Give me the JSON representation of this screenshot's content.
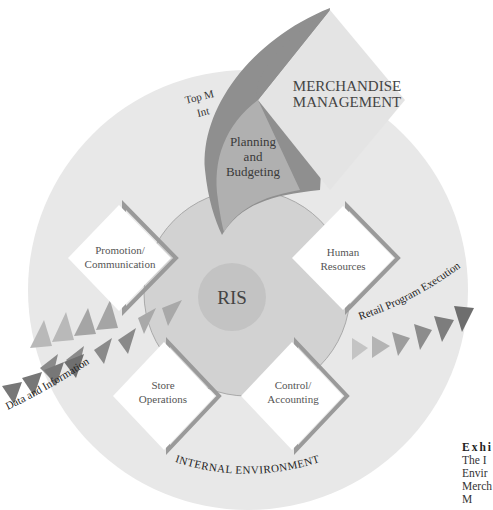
{
  "diagram": {
    "colors": {
      "outer_ring": "#e8e8e8",
      "inner_circle": "#d2d2d2",
      "ris_circle": "#c3c3c3",
      "diamond_fill": "#ffffff",
      "diamond_shadow": "#9a9a9a",
      "merch_diamond": "#e4e4e4",
      "swoosh_dark": "#8f8f8f",
      "swoosh_light": "#b0b0b0",
      "text": "#333333"
    },
    "outer_label": "INTERNAL ENVIRONMENT",
    "center_label": "RIS",
    "merchandise": {
      "line1": "MERCHANDISE",
      "line2": "MANAGEMENT"
    },
    "planning": {
      "line1": "Planning",
      "line2": "and",
      "line3": "Budgeting"
    },
    "top_management": {
      "line1": "Top M",
      "line2": "Int"
    },
    "diamonds": [
      {
        "line1": "Promotion/",
        "line2": "Communication"
      },
      {
        "line1": "Human",
        "line2": "Resources"
      },
      {
        "line1": "Store",
        "line2": "Operations"
      },
      {
        "line1": "Control/",
        "line2": "Accounting"
      }
    ],
    "flows": {
      "input_label": "Data and Information",
      "output_label": "Retail Program Execution"
    },
    "caption": {
      "title": "Exhi",
      "line1": "The I",
      "line2": "Envir",
      "line3": "Merch",
      "line4": "M"
    }
  }
}
